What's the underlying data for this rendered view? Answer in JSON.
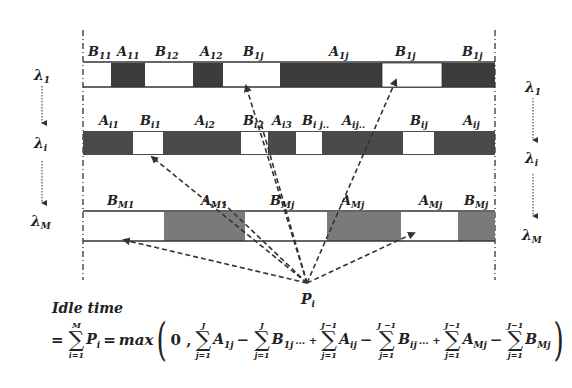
{
  "diagram": {
    "wavelengths": {
      "left": [
        "λ1",
        "λi",
        "λM"
      ],
      "right": [
        "λ1",
        "λi",
        "λM"
      ]
    },
    "rows": [
      {
        "name": "lambda-1",
        "labels": [
          "B11",
          "A11",
          "B12",
          "A12",
          "B1j",
          "A1j",
          "B1j",
          "B1j"
        ],
        "segments": [
          {
            "x1": 83,
            "x2": 111,
            "fill": "white"
          },
          {
            "x1": 111,
            "x2": 145,
            "fill": "dark"
          },
          {
            "x1": 145,
            "x2": 193,
            "fill": "white"
          },
          {
            "x1": 193,
            "x2": 223,
            "fill": "dark"
          },
          {
            "x1": 223,
            "x2": 280,
            "fill": "white"
          },
          {
            "x1": 280,
            "x2": 382,
            "fill": "dark"
          },
          {
            "x1": 382,
            "x2": 442,
            "fill": "white"
          },
          {
            "x1": 442,
            "x2": 495,
            "fill": "dark"
          }
        ]
      },
      {
        "name": "lambda-i",
        "labels": [
          "Ai1",
          "Bi1",
          "Ai2",
          "Bi2",
          "Ai3",
          "Bij..",
          "Aij..",
          "Bij",
          "Aij"
        ],
        "segments": [
          {
            "x1": 83,
            "x2": 133,
            "fill": "dark"
          },
          {
            "x1": 133,
            "x2": 163,
            "fill": "white"
          },
          {
            "x1": 163,
            "x2": 241,
            "fill": "dark"
          },
          {
            "x1": 241,
            "x2": 268,
            "fill": "white"
          },
          {
            "x1": 268,
            "x2": 296,
            "fill": "dark"
          },
          {
            "x1": 296,
            "x2": 322,
            "fill": "white"
          },
          {
            "x1": 322,
            "x2": 403,
            "fill": "dark"
          },
          {
            "x1": 403,
            "x2": 434,
            "fill": "white"
          },
          {
            "x1": 434,
            "x2": 495,
            "fill": "dark"
          }
        ]
      },
      {
        "name": "lambda-M",
        "labels": [
          "BM1",
          "AM1",
          "BMj",
          "AMj",
          "AMj",
          "BMj"
        ],
        "segments": [
          {
            "x1": 83,
            "x2": 164,
            "fill": "white"
          },
          {
            "x1": 164,
            "x2": 245,
            "fill": "gray"
          },
          {
            "x1": 245,
            "x2": 327,
            "fill": "white"
          },
          {
            "x1": 327,
            "x2": 401,
            "fill": "gray"
          },
          {
            "x1": 401,
            "x2": 458,
            "fill": "white"
          },
          {
            "x1": 458,
            "x2": 495,
            "fill": "gray"
          }
        ]
      }
    ],
    "convergence_point": "Pi",
    "colors": {
      "dark": "#3c3c3c",
      "gray": "#7a7a7a",
      "white": "#ffffff",
      "line": "#333333"
    }
  },
  "formula": {
    "title": "Idle time",
    "lead": "=",
    "outer_sum": {
      "upper": "M",
      "lower": "i=1",
      "term": "P",
      "sub": "i"
    },
    "equals": "=",
    "func": "max",
    "zero": "0 ,",
    "terms": [
      {
        "upper": "J",
        "lower": "j=1",
        "var": "A",
        "sub": "1j",
        "op_after": "−"
      },
      {
        "upper": "J",
        "lower": "j=1",
        "var": "B",
        "sub": "1j",
        "op_after": "… +"
      },
      {
        "upper": "J−1",
        "lower": "j=1",
        "var": "A",
        "sub": "ij",
        "op_after": "−"
      },
      {
        "upper": "J −1",
        "lower": "j=1",
        "var": "B",
        "sub": "ij",
        "op_after": "… +"
      },
      {
        "upper": "J−1",
        "lower": "j=1",
        "var": "A",
        "sub": "Mj",
        "op_after": "−"
      },
      {
        "upper": "J−1",
        "lower": "j=1",
        "var": "B",
        "sub": "Mj",
        "op_after": ""
      }
    ]
  }
}
